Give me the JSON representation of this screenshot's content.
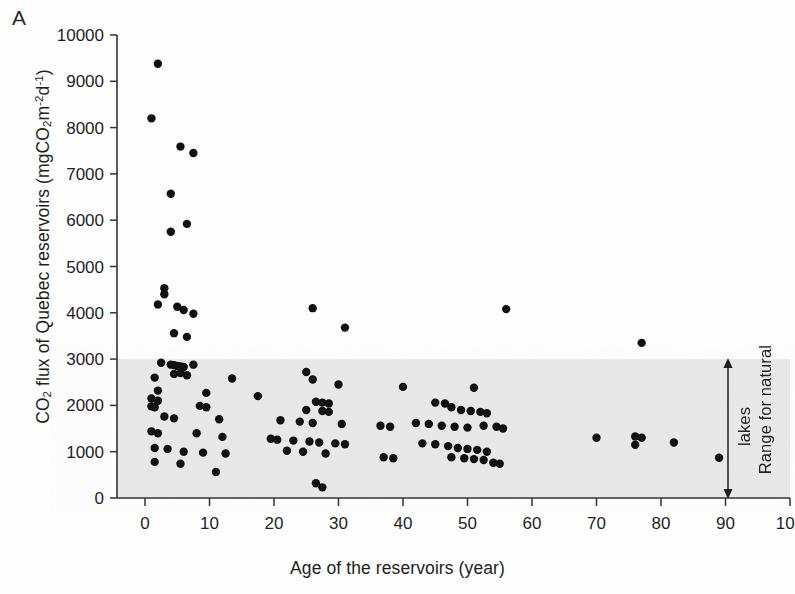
{
  "panel": {
    "label": "A"
  },
  "axes": {
    "y_label_pre": "CO",
    "y_label_sub1": "2",
    "y_label_mid": " flux of Quebec reservoirs (mgCO",
    "y_label_sub2": "2",
    "y_label_m": "m",
    "y_label_sup1": "-2",
    "y_label_d": "d",
    "y_label_sup2": "-1",
    "y_label_close": ")",
    "y_label_full": "CO2 flux of Quebec reservoirs (mgCO2m-2d-1)",
    "x_label": "Age of the reservoirs (year)",
    "y_ticks": [
      "0",
      "1000",
      "2000",
      "3000",
      "4000",
      "5000",
      "6000",
      "7000",
      "8000",
      "9000",
      "10000"
    ],
    "x_ticks": [
      "0",
      "10",
      "20",
      "30",
      "40",
      "50",
      "60",
      "70",
      "80",
      "90",
      "100"
    ]
  },
  "annotation": {
    "range_line1": "Range for natural",
    "range_line2": "lakes",
    "range_full": "Range for natural lakes"
  },
  "colors": {
    "marker": "#111111",
    "axis": "#333333",
    "band": "#e9e9e9",
    "background": "#fefefe",
    "text": "#1f1f1f"
  },
  "chart_data": {
    "type": "scatter",
    "xlabel": "Age of the reservoirs (year)",
    "ylabel": "CO2 flux of Quebec reservoirs (mgCO2 m-2 d-1)",
    "xlim": [
      0,
      100
    ],
    "ylim": [
      0,
      10000
    ],
    "xtick_step": 10,
    "ytick_step": 1000,
    "grid": false,
    "legend": null,
    "shaded_band": {
      "label": "Range for natural lakes",
      "y_from": 0,
      "y_to": 3000,
      "color": "#e9e9e9",
      "spans_full_width": true,
      "arrow": "double-headed vertical arrow at x = 91"
    },
    "series": [
      {
        "name": "Quebec reservoirs",
        "marker": "filled circle",
        "color": "#111111",
        "points": [
          [
            2.0,
            9380
          ],
          [
            1.0,
            8200
          ],
          [
            5.5,
            7590
          ],
          [
            7.5,
            7450
          ],
          [
            4.0,
            6570
          ],
          [
            6.5,
            5920
          ],
          [
            4.0,
            5750
          ],
          [
            3.0,
            4530
          ],
          [
            3.0,
            4400
          ],
          [
            2.0,
            4180
          ],
          [
            5.0,
            4130
          ],
          [
            6.0,
            4060
          ],
          [
            7.5,
            3980
          ],
          [
            26.0,
            4100
          ],
          [
            31.0,
            3680
          ],
          [
            56.0,
            4080
          ],
          [
            4.5,
            3560
          ],
          [
            6.5,
            3480
          ],
          [
            77.0,
            3350
          ],
          [
            2.5,
            2920
          ],
          [
            4.0,
            2880
          ],
          [
            4.5,
            2870
          ],
          [
            5.0,
            2850
          ],
          [
            5.5,
            2840
          ],
          [
            6.0,
            2830
          ],
          [
            7.5,
            2880
          ],
          [
            4.5,
            2680
          ],
          [
            5.5,
            2700
          ],
          [
            6.5,
            2650
          ],
          [
            1.5,
            2600
          ],
          [
            13.5,
            2580
          ],
          [
            25.0,
            2720
          ],
          [
            26.0,
            2560
          ],
          [
            30.0,
            2450
          ],
          [
            40.0,
            2400
          ],
          [
            51.0,
            2380
          ],
          [
            2.0,
            2320
          ],
          [
            9.5,
            2270
          ],
          [
            17.5,
            2200
          ],
          [
            1.0,
            2150
          ],
          [
            2.0,
            2100
          ],
          [
            1.0,
            1980
          ],
          [
            1.5,
            1960
          ],
          [
            8.5,
            1990
          ],
          [
            9.5,
            1960
          ],
          [
            26.5,
            2080
          ],
          [
            27.5,
            2060
          ],
          [
            28.5,
            2040
          ],
          [
            25.0,
            1900
          ],
          [
            27.5,
            1880
          ],
          [
            28.5,
            1860
          ],
          [
            45.0,
            2060
          ],
          [
            46.5,
            2040
          ],
          [
            47.5,
            1960
          ],
          [
            49.0,
            1900
          ],
          [
            50.5,
            1880
          ],
          [
            52.0,
            1860
          ],
          [
            53.0,
            1830
          ],
          [
            3.0,
            1760
          ],
          [
            4.5,
            1720
          ],
          [
            11.5,
            1700
          ],
          [
            21.0,
            1680
          ],
          [
            24.0,
            1650
          ],
          [
            26.0,
            1620
          ],
          [
            30.5,
            1600
          ],
          [
            36.5,
            1560
          ],
          [
            38.0,
            1540
          ],
          [
            42.0,
            1620
          ],
          [
            44.0,
            1600
          ],
          [
            46.0,
            1560
          ],
          [
            48.0,
            1540
          ],
          [
            50.0,
            1520
          ],
          [
            52.5,
            1560
          ],
          [
            54.5,
            1540
          ],
          [
            55.5,
            1500
          ],
          [
            70.0,
            1300
          ],
          [
            76.0,
            1330
          ],
          [
            77.0,
            1300
          ],
          [
            76.0,
            1150
          ],
          [
            82.0,
            1200
          ],
          [
            1.0,
            1440
          ],
          [
            2.0,
            1400
          ],
          [
            8.0,
            1400
          ],
          [
            12.0,
            1320
          ],
          [
            19.5,
            1280
          ],
          [
            20.5,
            1260
          ],
          [
            23.0,
            1240
          ],
          [
            25.5,
            1220
          ],
          [
            27.0,
            1200
          ],
          [
            29.5,
            1180
          ],
          [
            31.0,
            1160
          ],
          [
            37.0,
            880
          ],
          [
            38.5,
            860
          ],
          [
            43.0,
            1180
          ],
          [
            45.0,
            1160
          ],
          [
            47.0,
            1120
          ],
          [
            48.5,
            1080
          ],
          [
            50.0,
            1060
          ],
          [
            51.5,
            1040
          ],
          [
            53.0,
            1000
          ],
          [
            1.5,
            1080
          ],
          [
            3.5,
            1060
          ],
          [
            6.0,
            1000
          ],
          [
            9.0,
            980
          ],
          [
            12.5,
            960
          ],
          [
            22.0,
            1020
          ],
          [
            24.5,
            1000
          ],
          [
            28.0,
            960
          ],
          [
            47.5,
            880
          ],
          [
            49.5,
            860
          ],
          [
            51.0,
            840
          ],
          [
            52.5,
            820
          ],
          [
            89.0,
            870
          ],
          [
            1.5,
            780
          ],
          [
            5.5,
            740
          ],
          [
            11.0,
            560
          ],
          [
            26.5,
            320
          ],
          [
            27.5,
            230
          ],
          [
            54.0,
            760
          ],
          [
            55.0,
            740
          ]
        ]
      }
    ]
  }
}
